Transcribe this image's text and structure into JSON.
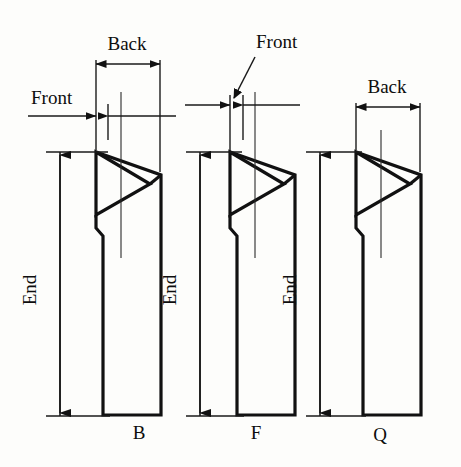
{
  "figure": {
    "background_color": "#fdfdfb",
    "line_color": "#111111",
    "width": 461,
    "height": 467,
    "dimension_labels": {
      "back": "Back",
      "front": "Front",
      "end": "End"
    },
    "views": [
      {
        "id": "b",
        "caption": "B",
        "caption_x": 139,
        "caption_y": 439,
        "origin_x": 0,
        "dimensions_shown": [
          "Back",
          "Front",
          "End"
        ],
        "back_label": "Back",
        "back_label_x": 127,
        "back_label_y": 50,
        "back_dim_x1": 96,
        "back_dim_x2": 160,
        "back_dim_y": 64,
        "front_label": "Front",
        "front_label_x": 31,
        "front_label_y": 104,
        "front_dim_y": 116,
        "front_dim_x1": 96,
        "front_dim_x2": 108,
        "front_leader": false,
        "end_label": "End",
        "end_label_x": 36,
        "end_label_y": 290,
        "end_dim_x": 60,
        "end_dim_y1": 153,
        "end_dim_y2": 416
      },
      {
        "id": "f",
        "caption": "F",
        "caption_x": 256,
        "caption_y": 439,
        "origin_x": 120,
        "dimensions_shown": [
          "Front",
          "End"
        ],
        "back_label": "",
        "front_label": "Front",
        "front_label_x": 256,
        "front_label_y": 48,
        "front_dim_y": 105,
        "front_dim_x1": 230,
        "front_dim_x2": 243,
        "front_leader": true,
        "front_leader_x1": 256,
        "front_leader_y1": 57,
        "front_leader_x2": 233,
        "front_leader_y2": 99,
        "end_label": "End",
        "end_label_x": 176,
        "end_label_y": 290,
        "end_dim_x": 200,
        "end_dim_y1": 153,
        "end_dim_y2": 416
      },
      {
        "id": "q",
        "caption": "Q",
        "caption_x": 380,
        "caption_y": 441,
        "origin_x": 260,
        "dimensions_shown": [
          "Back",
          "End"
        ],
        "back_label": "Back",
        "back_label_x": 387,
        "back_label_y": 93,
        "back_dim_x1": 356,
        "back_dim_x2": 420,
        "back_dim_y": 107,
        "front_label": "",
        "end_label": "End",
        "end_label_x": 296,
        "end_label_y": 290,
        "end_dim_x": 320,
        "end_dim_y1": 153,
        "end_dim_y2": 416
      }
    ],
    "tool_geometry": {
      "description": "triangular carbide insert on tapered shank",
      "insert_tip_x": 150,
      "insert_top_y": 152,
      "insert_bottom_y": 215,
      "shank_bottom_y": 415,
      "shank_right_x": 161
    }
  }
}
